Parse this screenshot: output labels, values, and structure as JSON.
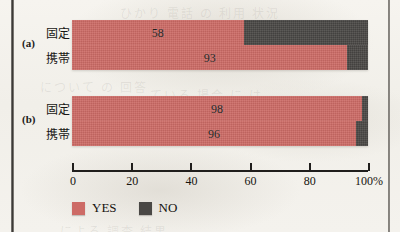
{
  "figure": {
    "groups": [
      {
        "tag": "(a)",
        "rows": [
          {
            "label": "固定",
            "yes": 58,
            "no": 42,
            "value_text": "58"
          },
          {
            "label": "携帯",
            "yes": 93,
            "no": 7,
            "value_text": "93"
          }
        ]
      },
      {
        "tag": "(b)",
        "rows": [
          {
            "label": "固定",
            "yes": 98,
            "no": 2,
            "value_text": "98"
          },
          {
            "label": "携帯",
            "yes": 96,
            "no": 4,
            "value_text": "96"
          }
        ]
      }
    ]
  },
  "axis": {
    "ticks": [
      {
        "value": 0,
        "label": "0"
      },
      {
        "value": 20,
        "label": "20"
      },
      {
        "value": 40,
        "label": "40"
      },
      {
        "value": 60,
        "label": "60"
      },
      {
        "value": 80,
        "label": "80"
      },
      {
        "value": 100,
        "label": "100%"
      }
    ]
  },
  "legend": {
    "items": [
      {
        "label": "YES",
        "color": "#cd6b66"
      },
      {
        "label": "NO",
        "color": "#4a4845"
      }
    ]
  },
  "colors": {
    "yes": "#cd6b66",
    "no": "#4a4845",
    "paper": "#f3f1ec",
    "ink": "#201e1c"
  },
  "chart_data": {
    "type": "bar",
    "orientation": "horizontal",
    "stacked": true,
    "stacked_normalized": true,
    "title": "",
    "subtitle": "",
    "xlabel": "",
    "ylabel": "",
    "xlim": [
      0,
      100
    ],
    "xunit": "%",
    "grid": false,
    "legend_position": "bottom-left",
    "xticks": [
      0,
      20,
      40,
      60,
      80,
      100
    ],
    "xticklabels": [
      "0",
      "20",
      "40",
      "60",
      "80",
      "100%"
    ],
    "panels": [
      {
        "name": "(a)",
        "categories": [
          "固定",
          "携帯"
        ],
        "series": [
          {
            "name": "YES",
            "color": "#cd6b66",
            "values": [
              58,
              93
            ]
          },
          {
            "name": "NO",
            "color": "#4a4845",
            "values": [
              42,
              7
            ]
          }
        ],
        "data_labels": [
          "58",
          "93"
        ]
      },
      {
        "name": "(b)",
        "categories": [
          "固定",
          "携帯"
        ],
        "series": [
          {
            "name": "YES",
            "color": "#cd6b66",
            "values": [
              98,
              96
            ]
          },
          {
            "name": "NO",
            "color": "#4a4845",
            "values": [
              2,
              4
            ]
          }
        ],
        "data_labels": [
          "98",
          "96"
        ]
      }
    ]
  },
  "ghosts": {
    "g1": "ひかり 電話 の 利用 状況",
    "g2": "について の 回答",
    "g3": "ている 場合 に は",
    "g4": "による 調査 結果"
  }
}
